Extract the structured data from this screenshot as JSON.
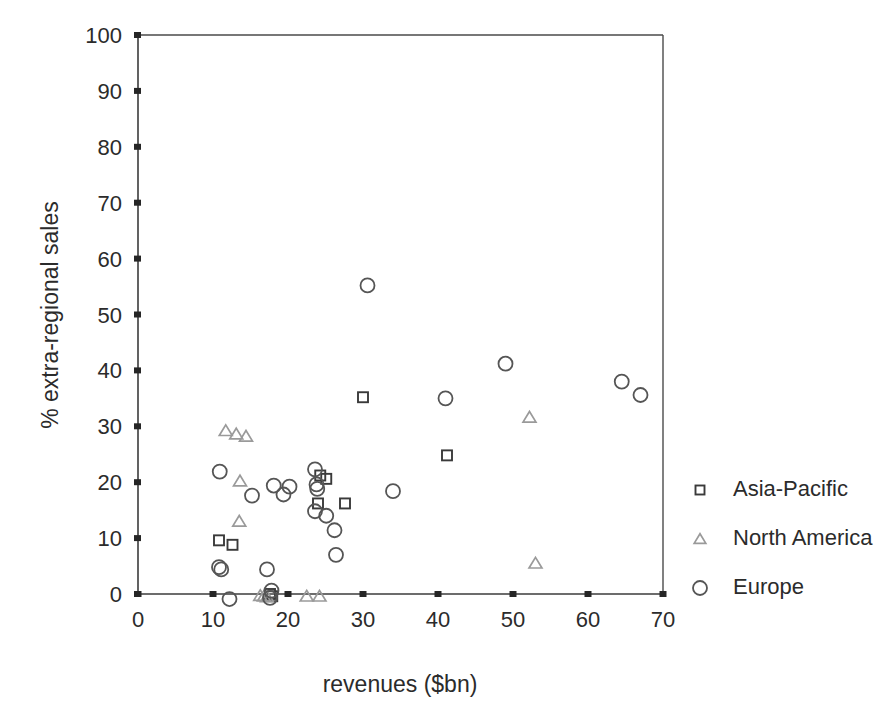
{
  "chart_data": {
    "type": "scatter",
    "title": "",
    "xlabel": "revenues ($bn)",
    "ylabel": "% extra-regional sales",
    "xlim": [
      0,
      70
    ],
    "ylim": [
      0,
      100
    ],
    "xticks": [
      0,
      10,
      20,
      30,
      40,
      50,
      60,
      70
    ],
    "yticks": [
      0,
      10,
      20,
      30,
      40,
      50,
      60,
      70,
      80,
      90,
      100
    ],
    "grid": false,
    "legend_position": "right",
    "series": [
      {
        "name": "Asia-Pacific",
        "marker": "square",
        "color": "#3a3a3a",
        "points": [
          [
            10.8,
            9.6
          ],
          [
            12.6,
            8.8
          ],
          [
            17.6,
            0.0
          ],
          [
            17.9,
            -0.4
          ],
          [
            24.3,
            21.2
          ],
          [
            25.1,
            20.6
          ],
          [
            24.0,
            16.2
          ],
          [
            30.0,
            35.2
          ],
          [
            27.6,
            16.2
          ],
          [
            41.2,
            24.8
          ]
        ]
      },
      {
        "name": "North America",
        "marker": "triangle",
        "color": "#9a9a9a",
        "points": [
          [
            11.7,
            29.2
          ],
          [
            13.1,
            28.6
          ],
          [
            14.4,
            28.2
          ],
          [
            13.6,
            20.2
          ],
          [
            13.5,
            13.0
          ],
          [
            16.3,
            -0.3
          ],
          [
            16.8,
            -0.4
          ],
          [
            17.2,
            -0.5
          ],
          [
            22.5,
            -0.4
          ],
          [
            24.2,
            -0.4
          ],
          [
            52.2,
            31.6
          ],
          [
            53.0,
            5.5
          ]
        ]
      },
      {
        "name": "Europe",
        "marker": "circle",
        "color": "#555555",
        "points": [
          [
            10.9,
            21.9
          ],
          [
            10.8,
            4.8
          ],
          [
            11.1,
            4.4
          ],
          [
            12.2,
            -0.9
          ],
          [
            15.2,
            17.6
          ],
          [
            17.2,
            4.4
          ],
          [
            17.8,
            0.6
          ],
          [
            17.6,
            -0.7
          ],
          [
            18.1,
            19.4
          ],
          [
            20.2,
            19.2
          ],
          [
            19.4,
            17.8
          ],
          [
            23.6,
            22.3
          ],
          [
            23.8,
            19.6
          ],
          [
            23.9,
            18.8
          ],
          [
            23.6,
            14.8
          ],
          [
            25.1,
            14.0
          ],
          [
            26.2,
            11.4
          ],
          [
            26.4,
            7.0
          ],
          [
            30.6,
            55.2
          ],
          [
            34.0,
            18.4
          ],
          [
            41.0,
            35.0
          ],
          [
            49.0,
            41.2
          ],
          [
            64.5,
            38.0
          ],
          [
            67.0,
            35.6
          ]
        ]
      }
    ]
  },
  "legend": {
    "items": [
      {
        "label": "Asia-Pacific",
        "marker": "square",
        "color": "#3a3a3a"
      },
      {
        "label": "North America",
        "marker": "triangle",
        "color": "#9a9a9a"
      },
      {
        "label": "Europe",
        "marker": "circle",
        "color": "#555555"
      }
    ]
  }
}
